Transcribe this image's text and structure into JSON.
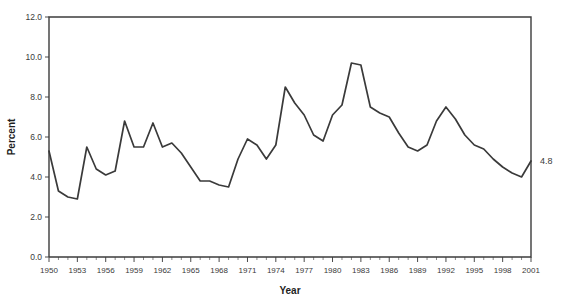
{
  "figure": {
    "title_partial": "",
    "end_annotation": "4.8"
  },
  "axes": {
    "x_title": "Year",
    "y_title": "Percent",
    "y_ticks": [
      "0.0",
      "2.0",
      "4.0",
      "6.0",
      "8.0",
      "10.0",
      "12.0"
    ],
    "x_ticks": [
      "1950",
      "1953",
      "1956",
      "1959",
      "1962",
      "1965",
      "1968",
      "1971",
      "1974",
      "1977",
      "1980",
      "1983",
      "1986",
      "1989",
      "1992",
      "1995",
      "1998",
      "2001"
    ]
  },
  "style": {
    "line_color": "#3a3a3a",
    "axis_color": "#3c3c3c",
    "text_color": "#3a3a3a",
    "background": "#ffffff"
  },
  "chart_data": {
    "type": "line",
    "title": "",
    "xlabel": "Year",
    "ylabel": "Percent",
    "xlim": [
      1950,
      2001
    ],
    "ylim": [
      0.0,
      12.0
    ],
    "ytick_step": 2.0,
    "xtick_step": 3,
    "grid": false,
    "legend": "none",
    "annotations": [
      {
        "text": "4.8",
        "x": 2001,
        "y": 4.8,
        "position": "right-of-axis"
      }
    ],
    "x": [
      1950,
      1951,
      1952,
      1953,
      1954,
      1955,
      1956,
      1957,
      1958,
      1959,
      1960,
      1961,
      1962,
      1963,
      1964,
      1965,
      1966,
      1967,
      1968,
      1969,
      1970,
      1971,
      1972,
      1973,
      1974,
      1975,
      1976,
      1977,
      1978,
      1979,
      1980,
      1981,
      1982,
      1983,
      1984,
      1985,
      1986,
      1987,
      1988,
      1989,
      1990,
      1991,
      1992,
      1993,
      1994,
      1995,
      1996,
      1997,
      1998,
      1999,
      2000,
      2001
    ],
    "series": [
      {
        "name": "Unemployment rate",
        "values": [
          5.3,
          3.3,
          3.0,
          2.9,
          5.5,
          4.4,
          4.1,
          4.3,
          6.8,
          5.5,
          5.5,
          6.7,
          5.5,
          5.7,
          5.2,
          4.5,
          3.8,
          3.8,
          3.6,
          3.5,
          4.9,
          5.9,
          5.6,
          4.9,
          5.6,
          8.5,
          7.7,
          7.1,
          6.1,
          5.8,
          7.1,
          7.6,
          9.7,
          9.6,
          7.5,
          7.2,
          7.0,
          6.2,
          5.5,
          5.3,
          5.6,
          6.8,
          7.5,
          6.9,
          6.1,
          5.6,
          5.4,
          4.9,
          4.5,
          4.2,
          4.0,
          4.8
        ]
      }
    ]
  }
}
